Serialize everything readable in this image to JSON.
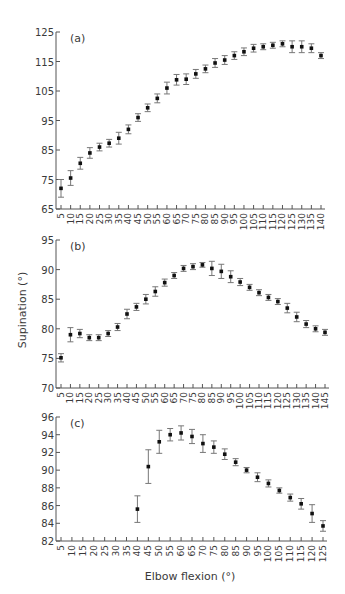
{
  "figure": {
    "ylabel": "Supination (°)",
    "xlabel": "Elbow flexion (°)"
  },
  "colors": {
    "axis": "#555555",
    "marker": "#111111",
    "errorbar": "#777777",
    "text": "#3a3a3a"
  },
  "chart_data": [
    {
      "type": "scatter",
      "panel": "(a)",
      "title": "",
      "xlabel": "",
      "ylabel": "",
      "ylim": [
        65,
        125
      ],
      "yticks": [
        65,
        75,
        85,
        95,
        105,
        115,
        125
      ],
      "xticks": [
        5,
        10,
        15,
        20,
        25,
        30,
        35,
        40,
        45,
        50,
        55,
        60,
        65,
        70,
        75,
        80,
        85,
        90,
        95,
        100,
        105,
        110,
        115,
        120,
        125,
        130,
        135,
        140
      ],
      "grid": false,
      "x": [
        5,
        10,
        15,
        20,
        25,
        30,
        35,
        40,
        45,
        50,
        55,
        60,
        65,
        70,
        75,
        80,
        85,
        90,
        95,
        100,
        105,
        110,
        115,
        120,
        125,
        130,
        135,
        140
      ],
      "values": [
        72,
        75.5,
        80.5,
        84,
        86,
        87.3,
        89,
        92,
        96,
        99.3,
        102.5,
        106,
        108.8,
        109,
        110.8,
        112.5,
        114.5,
        115.5,
        117,
        118.3,
        119.5,
        120,
        120.5,
        121,
        120,
        120,
        119.5,
        117
      ],
      "error": [
        3,
        2.5,
        2,
        1.8,
        1.3,
        1.3,
        2,
        1.5,
        1.3,
        1.3,
        1.5,
        2,
        1.8,
        1.8,
        1.5,
        1.3,
        1.5,
        1.5,
        1.3,
        1.3,
        1.3,
        1,
        1,
        1,
        2,
        2,
        1.5,
        1
      ]
    },
    {
      "type": "scatter",
      "panel": "(b)",
      "title": "",
      "xlabel": "",
      "ylabel": "Supination (°)",
      "ylim": [
        70,
        95
      ],
      "yticks": [
        70,
        75,
        80,
        85,
        90,
        95
      ],
      "xticks": [
        5,
        10,
        15,
        20,
        25,
        30,
        35,
        40,
        45,
        50,
        55,
        60,
        65,
        70,
        75,
        80,
        85,
        90,
        95,
        100,
        105,
        110,
        115,
        120,
        125,
        130,
        135,
        140,
        145
      ],
      "grid": false,
      "x": [
        5,
        10,
        15,
        20,
        25,
        30,
        35,
        40,
        45,
        50,
        55,
        60,
        65,
        70,
        75,
        80,
        85,
        90,
        95,
        100,
        105,
        110,
        115,
        120,
        125,
        130,
        135,
        140,
        145
      ],
      "values": [
        75.1,
        79,
        79.2,
        78.5,
        78.5,
        79.2,
        80.3,
        82.5,
        83.7,
        85,
        86.3,
        87.8,
        89,
        90.2,
        90.5,
        90.8,
        90.2,
        89.7,
        88.8,
        87.9,
        87,
        86.1,
        85.3,
        84.6,
        83.5,
        82,
        80.8,
        80,
        79.4
      ],
      "error": [
        0.7,
        1.2,
        0.7,
        0.5,
        0.5,
        0.5,
        0.6,
        0.8,
        0.6,
        0.8,
        0.8,
        0.6,
        0.5,
        0.5,
        0.5,
        0.4,
        1.2,
        1.2,
        1,
        0.6,
        0.5,
        0.5,
        0.5,
        0.5,
        0.8,
        0.8,
        0.6,
        0.5,
        0.5
      ]
    },
    {
      "type": "scatter",
      "panel": "(c)",
      "title": "",
      "xlabel": "Elbow flexion (°)",
      "ylabel": "",
      "ylim": [
        82,
        96
      ],
      "yticks": [
        82,
        84,
        86,
        88,
        90,
        92,
        94,
        96
      ],
      "xticks": [
        5,
        10,
        15,
        20,
        25,
        30,
        35,
        40,
        45,
        50,
        55,
        60,
        65,
        70,
        75,
        80,
        85,
        90,
        95,
        100,
        105,
        110,
        115,
        120,
        125
      ],
      "grid": false,
      "x": [
        40,
        45,
        50,
        55,
        60,
        65,
        70,
        75,
        80,
        85,
        90,
        95,
        100,
        105,
        110,
        115,
        120,
        125
      ],
      "values": [
        85.6,
        90.4,
        93.2,
        94,
        94.2,
        93.8,
        93,
        92.6,
        91.8,
        90.9,
        90,
        89.2,
        88.5,
        87.7,
        86.9,
        86.2,
        85.1,
        83.7
      ],
      "error": [
        1.5,
        1.9,
        1.3,
        0.7,
        0.8,
        0.8,
        1,
        0.7,
        0.6,
        0.4,
        0.3,
        0.5,
        0.4,
        0.3,
        0.4,
        0.6,
        1,
        0.6
      ]
    }
  ]
}
